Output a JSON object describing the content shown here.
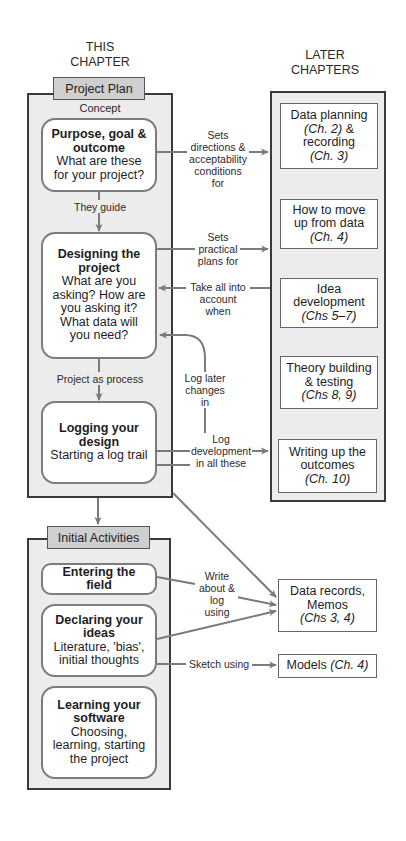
{
  "columns": {
    "left": {
      "line1": "THIS",
      "line2": "CHAPTER"
    },
    "right": {
      "line1": "LATER",
      "line2": "CHAPTERS"
    }
  },
  "project_plan": {
    "tab_label": "Project Plan",
    "section_label": "Concept",
    "boxes": [
      {
        "title": "Purpose, goal & outcome",
        "subtitle": "What are these for your project?"
      },
      {
        "title": "Designing the project",
        "subtitle": "What are you asking? How are you asking it? What data will you need?"
      },
      {
        "title": "Logging your design",
        "subtitle": "Starting a log trail"
      }
    ],
    "connectors": [
      {
        "label": "They guide"
      },
      {
        "label": "Project as process"
      }
    ]
  },
  "later_chapters": {
    "boxes": [
      {
        "text": "Data planning",
        "ref1": "(Ch. 2)",
        "mid": "& recording",
        "ref2": "(Ch. 3)"
      },
      {
        "text": "How to move up from data",
        "ref": "(Ch. 4)"
      },
      {
        "text": "Idea development",
        "ref": "(Chs 5–7)"
      },
      {
        "text": "Theory building & testing",
        "ref": "(Chs 8, 9)"
      },
      {
        "text": "Writing up the outcomes",
        "ref": "(Ch. 10)"
      }
    ]
  },
  "links": {
    "sets_directions": "Sets directions & acceptability conditions for",
    "sets_practical": "Sets practical plans for",
    "take_all": "Take all into account when",
    "log_later": "Log later changes in",
    "log_development": "Log development in all these",
    "write_about": "Write about & log using",
    "sketch_using": "Sketch using"
  },
  "initial_activities": {
    "tab_label": "Initial Activities",
    "boxes": [
      {
        "title": "Entering the field",
        "subtitle": ""
      },
      {
        "title": "Declaring your ideas",
        "subtitle": "Literature, 'bias', initial thoughts"
      },
      {
        "title": "Learning your software",
        "subtitle": "Choosing, learning, starting the project"
      }
    ]
  },
  "outputs": {
    "data_records": {
      "text": "Data records, Memos",
      "ref": "(Chs 3, 4)"
    },
    "models": {
      "text": "Models",
      "ref": "(Ch. 4)"
    }
  },
  "colors": {
    "panel_fill": "#ececec",
    "tab_fill": "#cfcfcf",
    "border_dark": "#3a3a3a",
    "arrow": "#7a7a7a"
  }
}
